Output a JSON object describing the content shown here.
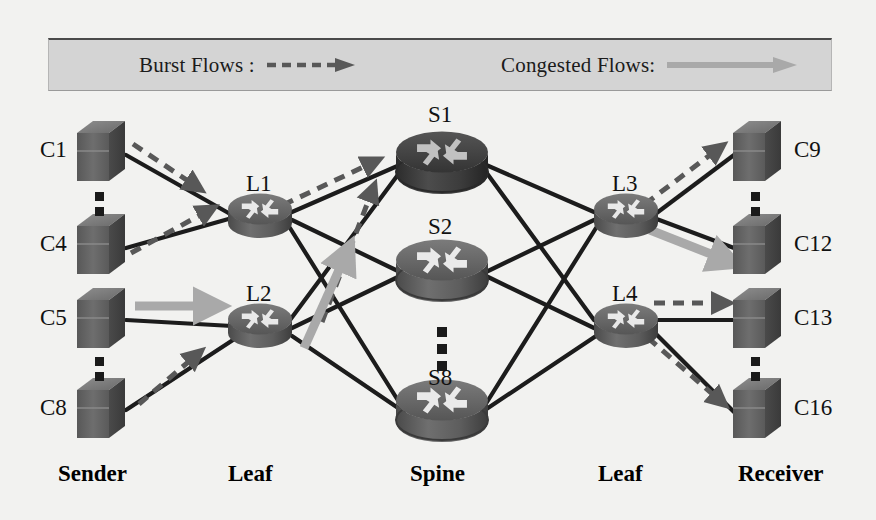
{
  "figure": {
    "type": "network-topology-diagram"
  },
  "legend": {
    "burst": {
      "label": "Burst Flows :",
      "style": "dashed-arrow",
      "color": "#585858"
    },
    "congested": {
      "label": "Congested Flows:",
      "style": "solid-thick-arrow",
      "color": "#a9a9a9"
    },
    "background": "#d4d4d4"
  },
  "tiers": [
    {
      "name": "tier-sender",
      "label": "Sender",
      "x": 110
    },
    {
      "name": "tier-leaf-left",
      "label": "Leaf",
      "x": 262
    },
    {
      "name": "tier-spine",
      "label": "Spine",
      "x": 440
    },
    {
      "name": "tier-leaf-right",
      "label": "Leaf",
      "x": 627
    },
    {
      "name": "tier-receiver",
      "label": "Receiver",
      "x": 790
    }
  ],
  "senders": [
    {
      "id": "C1",
      "label": "C1",
      "cx": 101,
      "cy": 151
    },
    {
      "id": "C4",
      "label": "C4",
      "cx": 101,
      "cy": 244
    },
    {
      "id": "C5",
      "label": "C5",
      "cx": 101,
      "cy": 318
    },
    {
      "id": "C8",
      "label": "C8",
      "cx": 101,
      "cy": 408
    }
  ],
  "receivers": [
    {
      "id": "C9",
      "label": "C9",
      "cx": 757,
      "cy": 151
    },
    {
      "id": "C12",
      "label": "C12",
      "cx": 757,
      "cy": 244
    },
    {
      "id": "C13",
      "label": "C13",
      "cx": 757,
      "cy": 318
    },
    {
      "id": "C16",
      "label": "C16",
      "cx": 757,
      "cy": 408
    }
  ],
  "leaf_left": [
    {
      "id": "L1",
      "label": "L1",
      "cx": 260,
      "cy": 215
    },
    {
      "id": "L2",
      "label": "L2",
      "cx": 260,
      "cy": 325
    }
  ],
  "leaf_right": [
    {
      "id": "L3",
      "label": "L3",
      "cx": 626,
      "cy": 215
    },
    {
      "id": "L4",
      "label": "L4",
      "cx": 626,
      "cy": 325
    }
  ],
  "spines": [
    {
      "id": "S1",
      "label": "S1",
      "cx": 442,
      "cy": 160
    },
    {
      "id": "S2",
      "label": "S2",
      "cx": 442,
      "cy": 268
    },
    {
      "id": "S8",
      "label": "S8",
      "cx": 442,
      "cy": 408
    }
  ],
  "ellipses": [
    {
      "name": "sender-ellipsis-1",
      "x": 101,
      "y": 200
    },
    {
      "name": "sender-ellipsis-2",
      "x": 101,
      "y": 365
    },
    {
      "name": "spine-ellipsis",
      "x": 442,
      "y": 340
    },
    {
      "name": "receiver-ellipsis-1",
      "x": 757,
      "y": 200
    },
    {
      "name": "receiver-ellipsis-2",
      "x": 757,
      "y": 365
    }
  ],
  "links": [
    {
      "from": "C1",
      "to": "L1"
    },
    {
      "from": "C4",
      "to": "L1"
    },
    {
      "from": "C5",
      "to": "L2"
    },
    {
      "from": "C8",
      "to": "L2"
    },
    {
      "from": "L1",
      "to": "S1"
    },
    {
      "from": "L1",
      "to": "S2"
    },
    {
      "from": "L1",
      "to": "S8"
    },
    {
      "from": "L2",
      "to": "S1"
    },
    {
      "from": "L2",
      "to": "S2"
    },
    {
      "from": "L2",
      "to": "S8"
    },
    {
      "from": "S1",
      "to": "L3"
    },
    {
      "from": "S1",
      "to": "L4"
    },
    {
      "from": "S2",
      "to": "L3"
    },
    {
      "from": "S2",
      "to": "L4"
    },
    {
      "from": "S8",
      "to": "L3"
    },
    {
      "from": "S8",
      "to": "L4"
    },
    {
      "from": "L3",
      "to": "C9"
    },
    {
      "from": "L3",
      "to": "C12"
    },
    {
      "from": "L4",
      "to": "C13"
    },
    {
      "from": "L4",
      "to": "C16"
    }
  ],
  "burst_flows": [
    {
      "from": "C1",
      "to": "L1"
    },
    {
      "from": "C4",
      "to": "L1"
    },
    {
      "from": "C8",
      "to": "L2"
    },
    {
      "from": "L1",
      "to": "S1"
    },
    {
      "from": "L2",
      "to": "S1"
    },
    {
      "from": "L3",
      "to": "C9"
    },
    {
      "from": "L4",
      "to": "C13"
    },
    {
      "from": "L4",
      "to": "C16"
    }
  ],
  "congested_flows": [
    {
      "from": "C5",
      "to": "L2"
    },
    {
      "from": "L2",
      "to": "S2"
    },
    {
      "from": "L3",
      "to": "C12"
    }
  ],
  "colors": {
    "background": "#f2f2f0",
    "link": "#1c1c1c",
    "router_body": "#6d6d6d",
    "router_top": "#5a5a5a",
    "router_dark": "#3a3a3a",
    "server_face": "#6a6a6a",
    "server_top": "#878787",
    "server_side": "#4e4e4e",
    "burst": "#585858",
    "congested": "#a9a9a9",
    "text": "#111111"
  }
}
